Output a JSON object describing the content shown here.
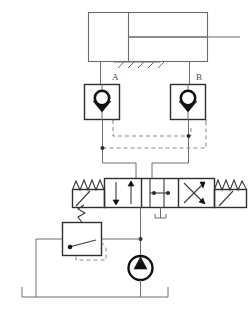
{
  "diagram": {
    "type": "hydraulic-schematic",
    "background_color": "#ffffff",
    "line_color": "#6e6e6e",
    "pilot_line_color": "#8a8a8a",
    "symbol_color": "#2f2f2f",
    "accent_color": "#111111"
  },
  "labels": {
    "port_a": "A",
    "port_b": "B"
  },
  "components": {
    "cylinder": {
      "name": "double-acting cylinder",
      "body": {
        "x": 88,
        "y": 12,
        "width": 120,
        "height": 50
      },
      "piston_x": 128,
      "rod": {
        "y": 37,
        "x_end": 240
      },
      "mount_hatch_count": 5,
      "port_left_x": 100,
      "port_right_x": 196
    },
    "check_valve_a": {
      "name": "pilot-operated check valve A",
      "box": {
        "x": 84,
        "y": 84,
        "width": 36,
        "height": 36
      },
      "label": "A",
      "symbol": "ball-and-seat"
    },
    "check_valve_b": {
      "name": "pilot-operated check valve B",
      "box": {
        "x": 170,
        "y": 84,
        "width": 36,
        "height": 36
      },
      "label": "B",
      "symbol": "ball-and-seat"
    },
    "directional_valve": {
      "name": "4/3 directional control valve, spring centered",
      "box": {
        "x": 104,
        "y": 178,
        "width": 110,
        "height": 30
      },
      "positions": 3,
      "envelopes": [
        "parallel-arrows",
        "closed-center-blocked",
        "crossed-arrows"
      ],
      "left_actuator": "spring-and-lever",
      "right_actuator": "spring-and-lever",
      "tank_port": true
    },
    "relief_valve": {
      "name": "pressure relief valve",
      "box": {
        "x": 62,
        "y": 222,
        "width": 40,
        "height": 34
      },
      "spring": true,
      "pilot_line": true,
      "arrow": "diagonal-up-left"
    },
    "pump": {
      "name": "fixed displacement hydraulic pump",
      "center": {
        "x": 140,
        "y": 268
      },
      "radius": 12,
      "arrow": "solid-triangle-up"
    },
    "reservoir": {
      "name": "reservoir / tank",
      "left_x": 22,
      "right_x": 168,
      "base_y": 297,
      "wall_height": 10
    }
  },
  "connections": {
    "cylinder_cap_to_valve_a": true,
    "cylinder_rod_to_valve_b": true,
    "valve_a_to_dcv_port_a": true,
    "valve_b_to_dcv_port_b": true,
    "pilot_a_from_b_line": true,
    "pilot_b_from_a_line": true,
    "pump_to_dcv_pressure": true,
    "relief_to_tank": true,
    "dcv_tank_drain": true
  }
}
